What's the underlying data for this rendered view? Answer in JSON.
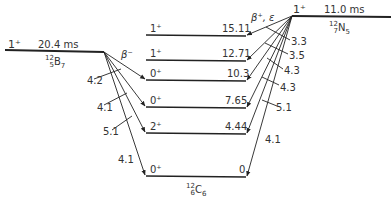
{
  "parent_left": {
    "nuclide": {
      "A": "12",
      "Z": "5",
      "symbol": "B",
      "N": "7"
    },
    "spin_parity": "1⁺",
    "half_life": "20.4 ms",
    "decay_mode": "β⁻"
  },
  "parent_right": {
    "nuclide": {
      "A": "12",
      "Z": "7",
      "symbol": "N",
      "N": "5"
    },
    "spin_parity": "1⁺",
    "half_life": "11.0 ms",
    "decay_mode": "β⁺, ε"
  },
  "daughter": {
    "nuclide": {
      "A": "12",
      "Z": "6",
      "symbol": "C",
      "N": "6"
    },
    "levels": [
      {
        "spin_parity": "1⁺",
        "energy": "15.11"
      },
      {
        "spin_parity": "1⁺",
        "energy": "12.71"
      },
      {
        "spin_parity": "0⁺",
        "energy": "10.3"
      },
      {
        "spin_parity": "0⁺",
        "energy": "7.65"
      },
      {
        "spin_parity": "2⁺",
        "energy": "4.44"
      },
      {
        "spin_parity": "0⁺",
        "energy": "0"
      }
    ]
  },
  "beta_minus_logft": [
    "4.2",
    "4.1",
    "5.1",
    "4.1"
  ],
  "beta_plus_logft": [
    "3.3",
    "3.5",
    "4.3",
    "4.3",
    "5.1",
    "4.1"
  ]
}
